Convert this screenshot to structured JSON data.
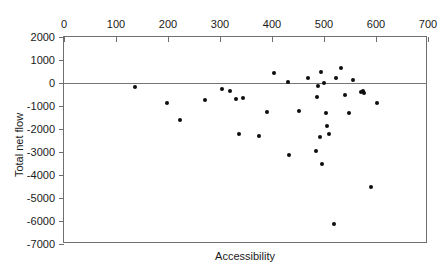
{
  "chart_data": {
    "type": "scatter",
    "title": "",
    "xlabel": "Accessibility",
    "ylabel": "Total net flow",
    "xlim": [
      0,
      700
    ],
    "ylim": [
      -7000,
      2000
    ],
    "xticks": [
      0,
      100,
      200,
      300,
      400,
      500,
      600,
      700
    ],
    "yticks": [
      2000,
      1000,
      0,
      -1000,
      -2000,
      -3000,
      -4000,
      -5000,
      -6000,
      -7000
    ],
    "x_axis_position": "top",
    "grid": false,
    "legend": null,
    "reference_lines": [
      {
        "axis": "y",
        "value": 0
      }
    ],
    "marker": {
      "shape": "circle",
      "color": "#0d0d0d",
      "size": 4
    },
    "points": [
      {
        "x": 137,
        "y": -190
      },
      {
        "x": 199,
        "y": -860
      },
      {
        "x": 224,
        "y": -1590
      },
      {
        "x": 272,
        "y": -740
      },
      {
        "x": 303,
        "y": -260
      },
      {
        "x": 320,
        "y": -330
      },
      {
        "x": 331,
        "y": -690
      },
      {
        "x": 336,
        "y": -2230
      },
      {
        "x": 344,
        "y": -650
      },
      {
        "x": 375,
        "y": -2310
      },
      {
        "x": 390,
        "y": -1260
      },
      {
        "x": 404,
        "y": 430
      },
      {
        "x": 430,
        "y": 40
      },
      {
        "x": 433,
        "y": -3130
      },
      {
        "x": 452,
        "y": -1200
      },
      {
        "x": 470,
        "y": 200
      },
      {
        "x": 484,
        "y": -2970
      },
      {
        "x": 487,
        "y": -630
      },
      {
        "x": 489,
        "y": -110
      },
      {
        "x": 492,
        "y": -2340
      },
      {
        "x": 494,
        "y": 470
      },
      {
        "x": 497,
        "y": -3520
      },
      {
        "x": 500,
        "y": 20
      },
      {
        "x": 503,
        "y": -1290
      },
      {
        "x": 506,
        "y": -1860
      },
      {
        "x": 509,
        "y": -2200
      },
      {
        "x": 519,
        "y": -6150
      },
      {
        "x": 523,
        "y": 200
      },
      {
        "x": 533,
        "y": 660
      },
      {
        "x": 541,
        "y": -510
      },
      {
        "x": 548,
        "y": -1310
      },
      {
        "x": 556,
        "y": 110
      },
      {
        "x": 571,
        "y": -370
      },
      {
        "x": 575,
        "y": -340
      },
      {
        "x": 577,
        "y": -450
      },
      {
        "x": 590,
        "y": -4500
      },
      {
        "x": 602,
        "y": -880
      }
    ]
  }
}
